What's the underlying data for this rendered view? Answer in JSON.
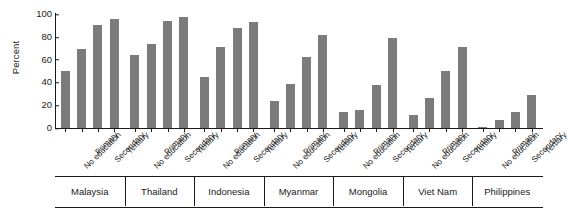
{
  "chart_data": {
    "type": "bar",
    "title": "",
    "xlabel": "",
    "ylabel": "Percent",
    "ylim": [
      0,
      100
    ],
    "yticks": [
      0,
      20,
      40,
      60,
      80,
      100
    ],
    "grid": false,
    "legend": "none",
    "bar_color": "#7b7b7b",
    "categories": [
      "No education",
      "Primary",
      "Secondary",
      "Tertiary"
    ],
    "groups": [
      "Malaysia",
      "Thailand",
      "Indonesia",
      "Myanmar",
      "Mongolia",
      "Viet Nam",
      "Philippines"
    ],
    "series": [
      {
        "name": "Malaysia",
        "values": [
          50,
          69,
          90,
          96
        ]
      },
      {
        "name": "Thailand",
        "values": [
          64,
          74,
          94,
          97
        ]
      },
      {
        "name": "Indonesia",
        "values": [
          45,
          71,
          88,
          93
        ]
      },
      {
        "name": "Myanmar",
        "values": [
          24,
          39,
          62,
          82
        ]
      },
      {
        "name": "Mongolia",
        "values": [
          14,
          16,
          38,
          79
        ]
      },
      {
        "name": "Viet Nam",
        "values": [
          11,
          26,
          50,
          71
        ]
      },
      {
        "name": "Philippines",
        "values": [
          1,
          7,
          14,
          29
        ]
      }
    ]
  }
}
